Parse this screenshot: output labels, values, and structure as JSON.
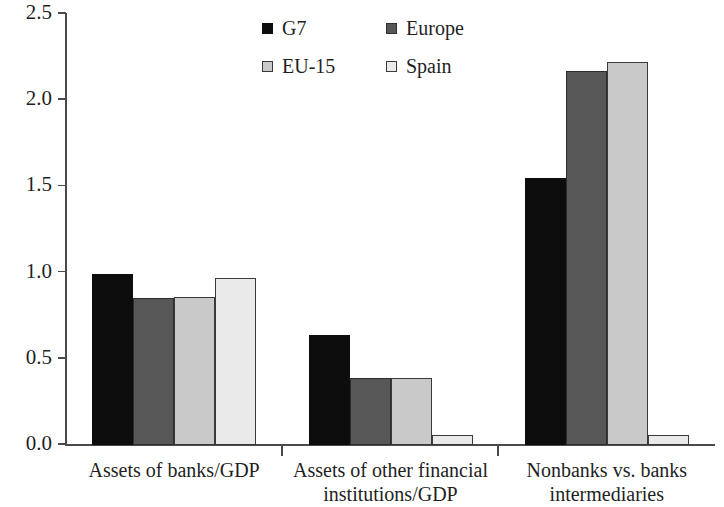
{
  "chart_data": {
    "type": "bar",
    "title": "",
    "subtitle": "",
    "xlabel": "",
    "ylabel": "",
    "ylim": [
      0.0,
      2.5
    ],
    "yticks": [
      "0.0",
      "0.5",
      "1.0",
      "1.5",
      "2.0",
      "2.5"
    ],
    "ytick_values": [
      0.0,
      0.5,
      1.0,
      1.5,
      2.0,
      2.5
    ],
    "grid": false,
    "legend_position": "top-center",
    "categories": [
      "Assets of banks/GDP",
      "Assets of other financial institutions/GDP",
      "Nonbanks vs. banks intermediaries"
    ],
    "category_lines": [
      [
        "Assets of banks/GDP"
      ],
      [
        "Assets of other financial",
        "institutions/GDP"
      ],
      [
        "Nonbanks vs. banks",
        "intermediaries"
      ]
    ],
    "series": [
      {
        "name": "G7",
        "color": "#0d0d0d",
        "border": "#0d0d0d",
        "values": [
          0.99,
          0.64,
          1.55
        ]
      },
      {
        "name": "Europe",
        "color": "#575757",
        "border": "#2e2e2e",
        "values": [
          0.85,
          0.39,
          2.17
        ]
      },
      {
        "name": "EU-15",
        "color": "#c9c9c9",
        "border": "#3a3a3a",
        "values": [
          0.86,
          0.39,
          2.22
        ]
      },
      {
        "name": "Spain",
        "color": "#eaeaea",
        "border": "#3a3a3a",
        "values": [
          0.97,
          0.06,
          0.06
        ]
      }
    ]
  },
  "legend": {
    "items": [
      {
        "label": "G7"
      },
      {
        "label": "Europe"
      },
      {
        "label": "EU-15"
      },
      {
        "label": "Spain"
      }
    ]
  },
  "axis": {
    "y_labels": [
      "2.5",
      "2.0",
      "1.5",
      "1.0",
      "0.5",
      "0.0"
    ]
  }
}
